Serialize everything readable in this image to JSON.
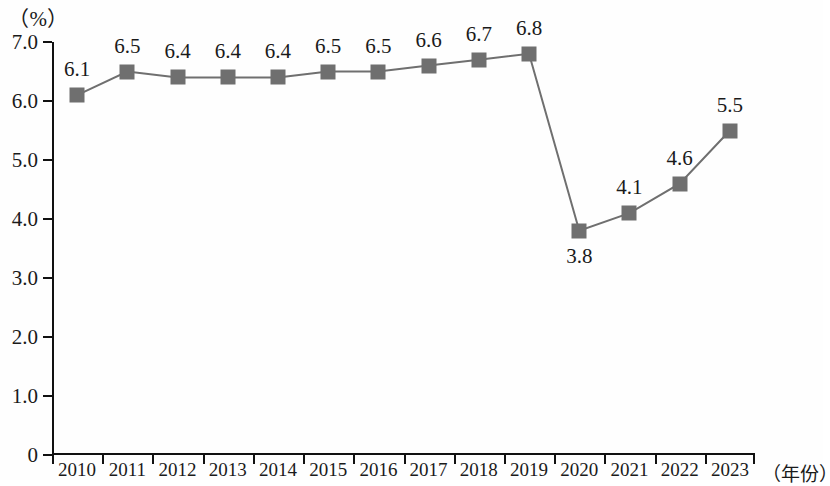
{
  "chart_data": {
    "type": "line",
    "title": "",
    "subtitle": "",
    "xlabel": "（年份）",
    "ylabel": "（%）",
    "categories": [
      "2010",
      "2011",
      "2012",
      "2013",
      "2014",
      "2015",
      "2016",
      "2017",
      "2018",
      "2019",
      "2020",
      "2021",
      "2022",
      "2023"
    ],
    "values": [
      6.1,
      6.5,
      6.4,
      6.4,
      6.4,
      6.5,
      6.5,
      6.6,
      6.7,
      6.8,
      3.8,
      4.1,
      4.6,
      5.5
    ],
    "point_labels": [
      "6.1",
      "6.5",
      "6.4",
      "6.4",
      "6.4",
      "6.5",
      "6.5",
      "6.6",
      "6.7",
      "6.8",
      "3.8",
      "4.1",
      "4.6",
      "5.5"
    ],
    "label_positions": [
      "above",
      "above",
      "above",
      "above",
      "above",
      "above",
      "above",
      "above",
      "above",
      "above",
      "below",
      "above",
      "above",
      "above"
    ],
    "ylim": [
      0,
      7.0
    ],
    "ytick_labels": [
      "7.0",
      "6.0",
      "5.0",
      "4.0",
      "3.0",
      "2.0",
      "1.0",
      "0"
    ],
    "ytick_values": [
      7.0,
      6.0,
      5.0,
      4.0,
      3.0,
      2.0,
      1.0,
      0
    ],
    "grid": false,
    "legend": null,
    "legend_position": "none",
    "series_color": "#6f6f6f",
    "line_color": "#6f6f6f",
    "axis_color": "#111111",
    "marker": "square"
  }
}
